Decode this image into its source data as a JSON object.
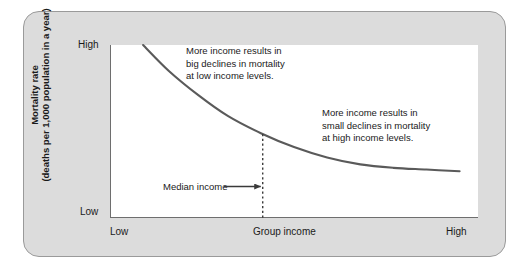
{
  "figure": {
    "yaxis": {
      "title_line1": "Mortality rate",
      "title_line2": "(deaths per 1,000 population in a year)",
      "tick_high": "High",
      "tick_low": "Low"
    },
    "xaxis": {
      "title": "Group income",
      "tick_low": "Low",
      "tick_high": "High"
    },
    "annotations": {
      "left_line1": "More income results in",
      "left_line2": "big declines in mortality",
      "left_line3": "at low income levels.",
      "right_line1": "More income results in",
      "right_line2": "small declines in mortality",
      "right_line3": "at high income levels.",
      "median_label": "Median income"
    },
    "colors": {
      "card_fill": "#dcdcdc",
      "card_border": "#9a9a9a",
      "panel_fill": "#ffffff",
      "axis": "#6e6e6e",
      "curve": "#5a5a5a",
      "text": "#1a1a1a"
    }
  },
  "chart_data": {
    "type": "line",
    "title": "",
    "xlabel": "Group income",
    "ylabel": "Mortality rate (deaths per 1,000 population in a year)",
    "xlim": [
      0,
      1
    ],
    "ylim": [
      0,
      1
    ],
    "xtick_labels": [
      "Low",
      "High"
    ],
    "ytick_labels": [
      "Low",
      "High"
    ],
    "grid": false,
    "legend": null,
    "series": [
      {
        "name": "Mortality vs. income",
        "x": [
          0.09,
          0.16,
          0.24,
          0.32,
          0.41,
          0.5,
          0.59,
          0.68,
          0.77,
          0.86,
          0.95
        ],
        "y": [
          1.0,
          0.85,
          0.71,
          0.59,
          0.49,
          0.41,
          0.35,
          0.31,
          0.29,
          0.28,
          0.27
        ]
      }
    ],
    "reference_lines": [
      {
        "name": "Median income",
        "orientation": "vertical",
        "x": 0.415,
        "style": "dashed",
        "label": "Median income"
      }
    ],
    "annotations": [
      {
        "text": "More income results in big declines in mortality at low income levels.",
        "x": 0.21,
        "y": 0.93
      },
      {
        "text": "More income results in small declines in mortality at high income levels.",
        "x": 0.58,
        "y": 0.58
      }
    ]
  }
}
